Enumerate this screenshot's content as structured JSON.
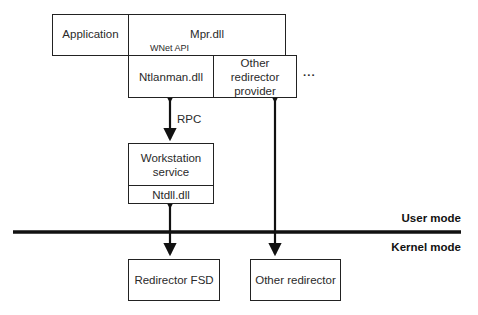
{
  "diagram": {
    "boxes": {
      "application": "Application",
      "mpr": "Mpr.dll",
      "ntlanman": "Ntlanman.dll",
      "other_provider": "Other redirector provider",
      "workstation": "Workstation service",
      "ntdll": "Ntdll.dll",
      "redirector_fsd": "Redirector FSD",
      "other_redirector": "Other redirector"
    },
    "labels": {
      "wnet_api": "WNet API",
      "rpc": "RPC",
      "ellipsis": "...",
      "user_mode": "User mode",
      "kernel_mode": "Kernel mode"
    },
    "colors": {
      "line": "#111111",
      "box_border": "#222222",
      "background": "#ffffff"
    }
  }
}
